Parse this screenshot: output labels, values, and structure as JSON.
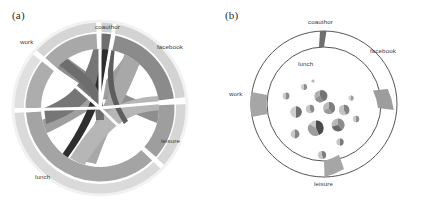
{
  "figure": {
    "background": "#ffffff",
    "width": 432,
    "height": 201
  },
  "panels": [
    {
      "id": "a",
      "label": "(a)",
      "type": "chord-diagram",
      "description": "Circular chord diagram with an outer light-grey annulus, an inner grey ring, and grey ribbons connecting the sectors across the centre.",
      "sectors": [
        {
          "name": "work",
          "label": "work",
          "label_x": 20,
          "label_y": 42,
          "start_deg": 200,
          "end_deg": 290,
          "outer_color": "#d2d2d2",
          "inner_color": "#a9a9a9"
        },
        {
          "name": "coauthor",
          "label": "coauthor",
          "label_x": 95,
          "label_y": 27,
          "start_deg": 294,
          "end_deg": 305,
          "outer_color": "#cfcfcf",
          "inner_color": "#6d6d6d"
        },
        {
          "name": "facebook",
          "label": "facebook",
          "label_x": 158,
          "label_y": 47,
          "start_deg": 309,
          "end_deg": 8,
          "outer_color": "#cbcbcb",
          "inner_color": "#8f8f8f"
        },
        {
          "name": "leisure",
          "label": "leisure",
          "label_x": 162,
          "label_y": 141,
          "start_deg": 12,
          "end_deg": 84,
          "outer_color": "#c9c9c9",
          "inner_color": "#9b9b9b"
        },
        {
          "name": "lunch",
          "label": "lunch",
          "label_x": 36,
          "label_y": 178,
          "start_deg": 88,
          "end_deg": 196,
          "outer_color": "#cdcdcd",
          "inner_color": "#a3a3a3"
        }
      ],
      "ribbon_colors": [
        "#6a6a6a",
        "#8b8b8b",
        "#a0a0a0",
        "#b4b4b4",
        "#4b4b4b",
        "#2a2a2a"
      ]
    },
    {
      "id": "b",
      "label": "(b)",
      "type": "annulus-with-node-pies",
      "description": "Outline annulus with five shaded arc segments marking the same categories, and small multi-slice pie glyphs scattered inside the inner circle.",
      "sectors": [
        {
          "name": "coauthor",
          "label": "coauthor",
          "label_x": 113,
          "label_y": 20,
          "center_deg": 272,
          "span_deg": 5,
          "color": "#7b7b7b"
        },
        {
          "name": "facebook",
          "label": "facebook",
          "label_x": 156,
          "label_y": 48,
          "center_deg": 325,
          "span_deg": 14,
          "color": "#9a9a9a"
        },
        {
          "name": "work",
          "label": "work",
          "label_x": 14,
          "label_y": 92,
          "center_deg": 180,
          "span_deg": 20,
          "color": "#a5a5a5"
        },
        {
          "name": "leisure",
          "label": "leisure",
          "label_x": 101,
          "label_y": 182,
          "center_deg": 72,
          "span_deg": 14,
          "color": "#a5a5a5"
        },
        {
          "name": "lunch",
          "label": "lunch",
          "label_x": 82,
          "label_y": 60,
          "center_deg": null,
          "span_deg": 0,
          "color": "#ffffff"
        }
      ],
      "ring": {
        "outer_radius": 73,
        "inner_radius": 57,
        "node_circle_radius": 47,
        "stroke": "#555555"
      },
      "nodes": [
        {
          "cx": 100,
          "cy": 104,
          "r": 7.5,
          "slices": [
            {
              "frac": 0.42,
              "color": "#4a4a4a"
            },
            {
              "frac": 0.3,
              "color": "#9d9d9d"
            },
            {
              "frac": 0.28,
              "color": "#c8c8c8"
            }
          ]
        },
        {
          "cx": 122,
          "cy": 101,
          "r": 6.5,
          "slices": [
            {
              "frac": 0.35,
              "color": "#8d8d8d"
            },
            {
              "frac": 0.33,
              "color": "#b8b8b8"
            },
            {
              "frac": 0.32,
              "color": "#6a6a6a"
            }
          ]
        },
        {
          "cx": 113,
          "cy": 84,
          "r": 6.0,
          "slices": [
            {
              "frac": 0.4,
              "color": "#7f7f7f"
            },
            {
              "frac": 0.35,
              "color": "#bcbcbc"
            },
            {
              "frac": 0.25,
              "color": "#9a9a9a"
            }
          ]
        },
        {
          "cx": 80,
          "cy": 88,
          "r": 5.8,
          "slices": [
            {
              "frac": 0.5,
              "color": "#6f6f6f"
            },
            {
              "frac": 0.5,
              "color": "#cfcfcf"
            }
          ]
        },
        {
          "cx": 94,
          "cy": 85,
          "r": 4.2,
          "slices": [
            {
              "frac": 0.45,
              "color": "#8a8a8a"
            },
            {
              "frac": 0.55,
              "color": "#c4c4c4"
            }
          ]
        },
        {
          "cx": 104,
          "cy": 72,
          "r": 5.6,
          "slices": [
            {
              "frac": 0.38,
              "color": "#757575"
            },
            {
              "frac": 0.34,
              "color": "#b0b0b0"
            },
            {
              "frac": 0.28,
              "color": "#909090"
            }
          ]
        },
        {
          "cx": 128,
          "cy": 86,
          "r": 5.2,
          "slices": [
            {
              "frac": 0.42,
              "color": "#828282"
            },
            {
              "frac": 0.58,
              "color": "#c2c2c2"
            }
          ]
        },
        {
          "cx": 70,
          "cy": 72,
          "r": 3.4,
          "slices": [
            {
              "frac": 0.5,
              "color": "#8c8c8c"
            },
            {
              "frac": 0.5,
              "color": "#c9c9c9"
            }
          ]
        },
        {
          "cx": 88,
          "cy": 63,
          "r": 3.0,
          "slices": [
            {
              "frac": 0.5,
              "color": "#8c8c8c"
            },
            {
              "frac": 0.5,
              "color": "#cccccc"
            }
          ]
        },
        {
          "cx": 140,
          "cy": 95,
          "r": 3.2,
          "slices": [
            {
              "frac": 0.5,
              "color": "#8f8f8f"
            },
            {
              "frac": 0.5,
              "color": "#cacaca"
            }
          ]
        },
        {
          "cx": 124,
          "cy": 118,
          "r": 3.6,
          "slices": [
            {
              "frac": 0.5,
              "color": "#7a7a7a"
            },
            {
              "frac": 0.5,
              "color": "#c6c6c6"
            }
          ]
        },
        {
          "cx": 106,
          "cy": 131,
          "r": 4.0,
          "slices": [
            {
              "frac": 0.45,
              "color": "#7d7d7d"
            },
            {
              "frac": 0.55,
              "color": "#c5c5c5"
            }
          ]
        },
        {
          "cx": 79,
          "cy": 110,
          "r": 4.4,
          "slices": [
            {
              "frac": 0.5,
              "color": "#858585"
            },
            {
              "frac": 0.5,
              "color": "#c7c7c7"
            }
          ]
        },
        {
          "cx": 135,
          "cy": 74,
          "r": 2.6,
          "slices": [
            {
              "frac": 0.5,
              "color": "#9b9b9b"
            },
            {
              "frac": 0.5,
              "color": "#d0d0d0"
            }
          ]
        },
        {
          "cx": 97,
          "cy": 57,
          "r": 1.6,
          "slices": [
            {
              "frac": 1.0,
              "color": "#b4b4b4"
            }
          ]
        }
      ]
    }
  ]
}
